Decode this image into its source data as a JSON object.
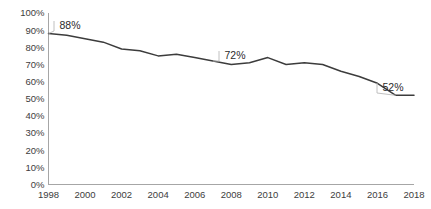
{
  "chart_data": {
    "type": "line",
    "title": "",
    "xlabel": "",
    "ylabel": "",
    "x": [
      1998,
      1999,
      2000,
      2001,
      2002,
      2003,
      2004,
      2005,
      2006,
      2007,
      2008,
      2009,
      2010,
      2011,
      2012,
      2013,
      2014,
      2015,
      2016,
      2017,
      2018
    ],
    "values": [
      88,
      87,
      85,
      83,
      79,
      78,
      75,
      76,
      74,
      72,
      70,
      71,
      74,
      70,
      71,
      70,
      66,
      63,
      59,
      52,
      52
    ],
    "categories": [
      "1998",
      "1999",
      "2000",
      "2001",
      "2002",
      "2003",
      "2004",
      "2005",
      "2006",
      "2007",
      "2008",
      "2009",
      "2010",
      "2011",
      "2012",
      "2013",
      "2014",
      "2015",
      "2016",
      "2017",
      "2018"
    ],
    "series": [
      {
        "name": "",
        "values": [
          88,
          87,
          85,
          83,
          79,
          78,
          75,
          76,
          74,
          72,
          70,
          71,
          74,
          70,
          71,
          70,
          66,
          63,
          59,
          52,
          52
        ]
      }
    ],
    "xlim": [
      1998,
      2018
    ],
    "ylim": [
      0,
      100
    ],
    "grid": false,
    "legend": "none",
    "value_suffix": "%",
    "line_color": "#3c3c3c",
    "axis_color": "#a6a6a6",
    "background_color": "#ffffff",
    "y_ticks": [
      "0%",
      "10%",
      "20%",
      "30%",
      "40%",
      "50%",
      "60%",
      "70%",
      "80%",
      "90%",
      "100%"
    ],
    "y_tick_values": [
      0,
      10,
      20,
      30,
      40,
      50,
      60,
      70,
      80,
      90,
      100
    ],
    "x_ticks": [
      "1998",
      "2000",
      "2002",
      "2004",
      "2006",
      "2008",
      "2010",
      "2012",
      "2014",
      "2016",
      "2018"
    ],
    "x_tick_values": [
      1998,
      2000,
      2002,
      2004,
      2006,
      2008,
      2010,
      2012,
      2014,
      2016,
      2018
    ],
    "annotations": [
      {
        "label": "88%",
        "x": 1998,
        "y": 88,
        "label_x_px": 70,
        "label_y_px": 29
      },
      {
        "label": "72%",
        "x": 2007,
        "y": 72,
        "label_x_px": 235,
        "label_y_px": 59
      },
      {
        "label": "52%",
        "x": 2017,
        "y": 52,
        "label_x_px": 393,
        "label_y_px": 91
      }
    ]
  },
  "axes": {
    "plot_left_px": 48.5,
    "plot_right_px": 414,
    "plot_top_px": 13,
    "plot_bottom_px": 184.5
  }
}
